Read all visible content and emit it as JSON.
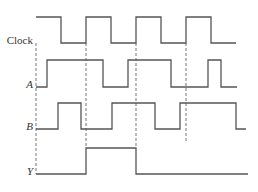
{
  "diagram": {
    "time_steps": [
      "t0",
      "t1",
      "t2",
      "t3",
      "t4",
      "t5",
      "t6",
      "t7",
      "t8"
    ],
    "signals": [
      {
        "name": "Clock",
        "italic": false,
        "transitions": [
          [
            0,
            1
          ],
          [
            0.5,
            0
          ],
          [
            1,
            1
          ],
          [
            1.5,
            0
          ],
          [
            2,
            1
          ],
          [
            2.5,
            0
          ],
          [
            3,
            1
          ],
          [
            3.5,
            0
          ],
          [
            4.0,
            0
          ]
        ]
      },
      {
        "name": "A",
        "italic": true,
        "transitions": [
          [
            0,
            0
          ],
          [
            0.22,
            1
          ],
          [
            1.34,
            0
          ],
          [
            1.84,
            1
          ],
          [
            2.7,
            0
          ],
          [
            3.44,
            1
          ],
          [
            3.7,
            0
          ],
          [
            4.02,
            0
          ]
        ]
      },
      {
        "name": "B",
        "italic": true,
        "transitions": [
          [
            0,
            0
          ],
          [
            0.44,
            1
          ],
          [
            0.9,
            0
          ],
          [
            1.52,
            1
          ],
          [
            2.38,
            0
          ],
          [
            2.88,
            1
          ],
          [
            4.0,
            0
          ],
          [
            4.2,
            0
          ]
        ]
      },
      {
        "name": "Y",
        "italic": true,
        "transitions": [
          [
            0,
            0
          ],
          [
            1.0,
            1
          ],
          [
            2.0,
            0
          ],
          [
            4.24,
            0
          ]
        ]
      }
    ],
    "guides": [
      {
        "at": 0,
        "from_signal": "Clock",
        "to_signal": "Y"
      },
      {
        "at": 1,
        "from_signal": "Clock",
        "to_signal": "Y"
      },
      {
        "at": 2,
        "from_signal": "Clock",
        "to_signal": "Y"
      },
      {
        "at": 3,
        "from_signal": "Clock",
        "to_signal": "B"
      }
    ]
  }
}
